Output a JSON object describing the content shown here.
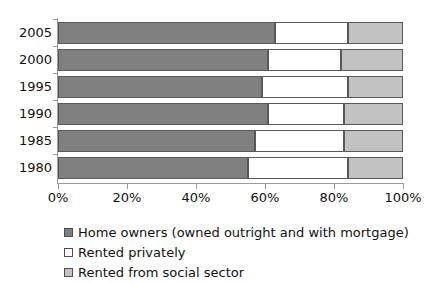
{
  "chart_data": {
    "type": "bar",
    "orientation": "horizontal",
    "stacked": true,
    "stack_mode": "percent",
    "title": "",
    "xlabel": "",
    "ylabel": "",
    "xlim": [
      0,
      100
    ],
    "grid": false,
    "legend_position": "bottom-left",
    "categories": [
      "2005",
      "2000",
      "1995",
      "1990",
      "1985",
      "1980"
    ],
    "x_tick_labels": [
      "0%",
      "20%",
      "40%",
      "60%",
      "80%",
      "100%"
    ],
    "x_tick_values": [
      0,
      20,
      40,
      60,
      80,
      100
    ],
    "series": [
      {
        "name": "Home owners (owned outright and with mortgage)",
        "color": "#808080",
        "values": [
          63,
          61,
          59,
          61,
          57,
          55
        ]
      },
      {
        "name": "Rented privately",
        "color": "#ffffff",
        "values": [
          21,
          21,
          25,
          22,
          26,
          29
        ]
      },
      {
        "name": "Rented from social sector",
        "color": "#c2c2c2",
        "values": [
          16,
          18,
          16,
          17,
          17,
          16
        ]
      }
    ]
  },
  "legend": {
    "items": [
      {
        "label": "Home owners (owned outright and with mortgage)",
        "swatch": "dark-gray"
      },
      {
        "label": "Rented privately",
        "swatch": "white"
      },
      {
        "label": "Rented from social sector",
        "swatch": "light-gray"
      }
    ]
  },
  "axis": {
    "category_labels": [
      "2005",
      "2000",
      "1995",
      "1990",
      "1985",
      "1980"
    ],
    "value_labels": [
      "0%",
      "20%",
      "40%",
      "60%",
      "80%",
      "100%"
    ]
  }
}
